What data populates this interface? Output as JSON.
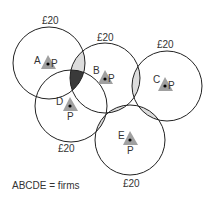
{
  "diagram": {
    "firms": [
      {
        "id": "A",
        "label": "A",
        "point_label": "P",
        "price_label": "£20",
        "cx": 49,
        "cy": 63,
        "r": 36,
        "price_pos": "top"
      },
      {
        "id": "B",
        "label": "B",
        "point_label": "P",
        "price_label": "£20",
        "cx": 105,
        "cy": 78,
        "r": 35,
        "price_pos": "top"
      },
      {
        "id": "C",
        "label": "C",
        "point_label": "P",
        "price_label": "£20",
        "cx": 167,
        "cy": 86,
        "r": 35,
        "price_pos": "top"
      },
      {
        "id": "D",
        "label": "D",
        "point_label": "P",
        "price_label": "£20",
        "cx": 71,
        "cy": 106,
        "r": 36,
        "price_pos": "bottom"
      },
      {
        "id": "E",
        "label": "E",
        "point_label": "P",
        "price_label": "£20",
        "cx": 130,
        "cy": 140,
        "r": 35,
        "price_pos": "bottom"
      }
    ],
    "legend": "ABCDE = firms",
    "colors": {
      "circle_stroke": "#222222",
      "overlap_light": "#dcdcdc",
      "overlap_dark": "#3a3a3a",
      "triangle": "#a0a0a0",
      "dot": "#000000",
      "text": "#333333"
    }
  }
}
